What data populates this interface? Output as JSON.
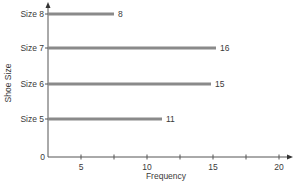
{
  "chart_data": {
    "type": "bar",
    "orientation": "horizontal",
    "title": "",
    "xlabel": "Frequency",
    "ylabel": "Shoe Size",
    "categories": [
      "Size 5",
      "Size 6",
      "Size 7",
      "Size 8"
    ],
    "values": [
      11,
      15,
      16,
      8
    ],
    "data_labels": [
      "11",
      "15",
      "16",
      "8"
    ],
    "x_ticks": [
      5,
      10,
      15,
      20
    ],
    "x_tick_labels": [
      "5",
      "10",
      "15",
      "20"
    ],
    "x_minor_ticks": [
      7.5,
      12.5,
      17.5
    ],
    "y_origin_label": "0",
    "xlim": [
      2.5,
      21
    ],
    "grid": false,
    "legend": null,
    "bar_color": "#8a8a8a",
    "axis_color": "#555555"
  },
  "layout": {
    "axis_x0": 48,
    "axis_y0": 157,
    "axis_top": 2,
    "axis_right": 293,
    "tick_px": {
      "5": 81,
      "7.5": 114,
      "10": 147,
      "12.5": 180,
      "15": 213,
      "17.5": 246,
      "20": 279
    },
    "bars": [
      {
        "y": 119,
        "end_x": 162
      },
      {
        "y": 84,
        "end_x": 211
      },
      {
        "y": 48,
        "end_x": 216
      },
      {
        "y": 14,
        "end_x": 114
      }
    ]
  }
}
